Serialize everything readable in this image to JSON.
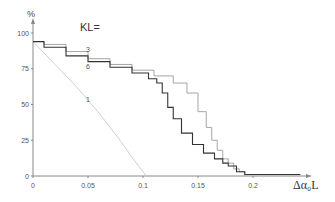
{
  "chart_data": {
    "type": "line",
    "title": "KL=",
    "xlabel": "Δα₀L",
    "ylabel": "%",
    "xlim": [
      0,
      0.25
    ],
    "ylim": [
      0,
      100
    ],
    "xticks": [
      0,
      0.05,
      0.1,
      0.15,
      0.2
    ],
    "xtick_labels": [
      "0",
      "0.05",
      "0.1",
      "0.15",
      "0.2"
    ],
    "yticks": [
      0,
      25,
      50,
      75,
      100
    ],
    "ytick_labels": [
      "0",
      "25",
      "50",
      "75",
      "100"
    ],
    "grid": false,
    "legend": "inline labels",
    "series": [
      {
        "name": "1",
        "color": "#c8c8c8",
        "label_pos": [
          0.05,
          52
        ],
        "x": [
          0,
          0.02,
          0.04,
          0.06,
          0.08,
          0.09,
          0.1,
          0.103
        ],
        "y": [
          94,
          78,
          62,
          44,
          24,
          13,
          3,
          0
        ]
      },
      {
        "name": "3",
        "color": "#9a9a9a",
        "label_pos": [
          0.05,
          87
        ],
        "x": [
          0,
          0.02,
          0.04,
          0.06,
          0.08,
          0.1,
          0.12,
          0.135,
          0.145,
          0.155,
          0.16,
          0.165,
          0.17,
          0.175,
          0.18,
          0.185,
          0.19,
          0.195,
          0.243
        ],
        "y": [
          94,
          92,
          87,
          82,
          78,
          74,
          70,
          65,
          58,
          45,
          34,
          25,
          18,
          12,
          9,
          5,
          3,
          1,
          1
        ]
      },
      {
        "name": "6",
        "color": "#333333",
        "label_pos": [
          0.05,
          75
        ],
        "x": [
          0,
          0.02,
          0.04,
          0.06,
          0.08,
          0.1,
          0.11,
          0.115,
          0.12,
          0.125,
          0.13,
          0.14,
          0.15,
          0.16,
          0.17,
          0.175,
          0.18,
          0.19,
          0.195,
          0.243
        ],
        "y": [
          94,
          90,
          84,
          80,
          76,
          72,
          68,
          65,
          58,
          48,
          40,
          30,
          22,
          16,
          12,
          9,
          7,
          3,
          1,
          1
        ]
      }
    ]
  }
}
